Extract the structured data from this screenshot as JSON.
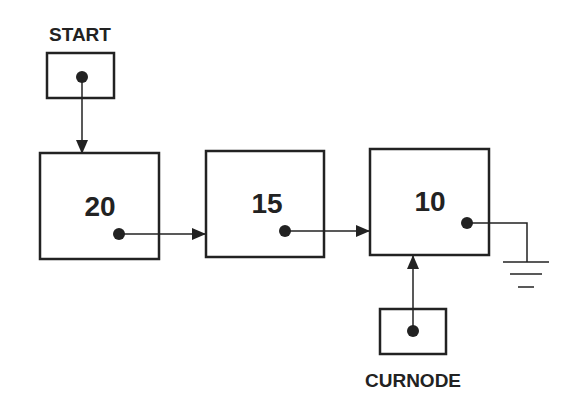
{
  "diagram": {
    "type": "linked-list",
    "pointers": {
      "start": {
        "label": "START"
      },
      "curnode": {
        "label": "CURNODE"
      }
    },
    "nodes": [
      {
        "value": "20"
      },
      {
        "value": "15"
      },
      {
        "value": "10"
      }
    ],
    "terminator": "ground-null-icon",
    "colors": {
      "stroke": "#222222",
      "background": "#ffffff"
    }
  }
}
